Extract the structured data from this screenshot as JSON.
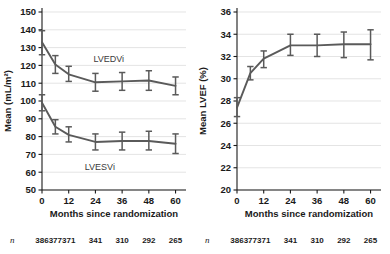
{
  "chart_data": [
    {
      "type": "line",
      "panel": "left",
      "title": "",
      "xlabel": "Months since randomization",
      "ylabel": "Mean (mL/m²)",
      "x": [
        0,
        6,
        12,
        24,
        36,
        48,
        60
      ],
      "xlim": [
        0,
        62
      ],
      "ylim": [
        50,
        150
      ],
      "xticks": [
        0,
        12,
        24,
        36,
        48,
        60
      ],
      "xticklabels": [
        "0",
        "12",
        "24",
        "36",
        "48",
        "60"
      ],
      "yticks": [
        50,
        60,
        70,
        80,
        90,
        100,
        110,
        120,
        130,
        140,
        150
      ],
      "yticklabels": [
        "50",
        "60",
        "70",
        "80",
        "90",
        "100",
        "110",
        "120",
        "130",
        "140",
        "150"
      ],
      "grid": true,
      "legend_position": "inline-annotation",
      "series": [
        {
          "name": "LVEDVi",
          "values": [
            133.0,
            120.5,
            115.0,
            110.5,
            111.0,
            111.5,
            108.5
          ],
          "err_low": [
            126.0,
            115.5,
            111.0,
            105.5,
            106.0,
            106.0,
            103.5
          ],
          "err_high": [
            139.5,
            125.5,
            119.5,
            115.5,
            116.0,
            117.0,
            113.5
          ]
        },
        {
          "name": "LVESVi",
          "values": [
            99.0,
            85.5,
            81.0,
            77.0,
            77.5,
            77.5,
            76.0
          ],
          "err_low": [
            94.5,
            81.5,
            77.0,
            72.5,
            72.5,
            72.5,
            70.5
          ],
          "err_high": [
            103.5,
            89.5,
            85.5,
            81.5,
            82.5,
            83.0,
            81.5
          ]
        }
      ],
      "annotations": [
        {
          "text": "LVEDVi",
          "x": 30,
          "y": 122
        },
        {
          "text": "LVESVi",
          "x": 26,
          "y": 61
        }
      ],
      "n_row_label": "n",
      "n_values": [
        "386",
        "377",
        "371",
        "341",
        "310",
        "292",
        "265"
      ]
    },
    {
      "type": "line",
      "panel": "right",
      "title": "",
      "xlabel": "Months since randomization",
      "ylabel": "Mean LVEF (%)",
      "x": [
        0,
        6,
        12,
        24,
        36,
        48,
        60
      ],
      "xlim": [
        0,
        62
      ],
      "ylim": [
        20,
        36
      ],
      "xticks": [
        0,
        12,
        24,
        36,
        48,
        60
      ],
      "xticklabels": [
        "0",
        "12",
        "24",
        "36",
        "48",
        "60"
      ],
      "yticks": [
        20,
        22,
        24,
        26,
        28,
        30,
        32,
        34,
        36
      ],
      "yticklabels": [
        "20",
        "22",
        "24",
        "26",
        "28",
        "30",
        "32",
        "34",
        "36"
      ],
      "grid": true,
      "legend_position": "none",
      "series": [
        {
          "name": "Mean LVEF (%)",
          "values": [
            27.4,
            30.5,
            31.8,
            33.0,
            33.0,
            33.1,
            33.1
          ],
          "err_low": [
            26.6,
            29.9,
            31.0,
            32.1,
            32.0,
            31.9,
            31.7
          ],
          "err_high": [
            28.3,
            31.1,
            32.5,
            34.0,
            34.0,
            34.2,
            34.4
          ]
        }
      ],
      "annotations": [],
      "n_row_label": "n",
      "n_values": [
        "386",
        "377",
        "371",
        "341",
        "310",
        "292",
        "265"
      ]
    }
  ],
  "colors": {
    "series_gray": "#5a5a5a",
    "axis_black": "#1a1a1a",
    "grid_gray": "#d9d9d9",
    "background": "#ffffff"
  }
}
